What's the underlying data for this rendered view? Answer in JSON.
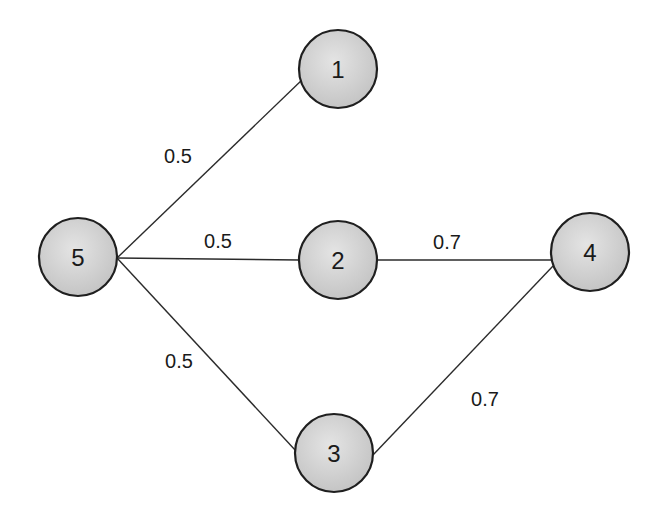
{
  "diagram": {
    "type": "weighted-graph",
    "colors": {
      "node_fill_light": "#e2e2e2",
      "node_fill_dark": "#c4c4c4",
      "node_stroke": "#1f1f1f",
      "edge": "#2b2b2b",
      "text": "#1a1a1a",
      "background": "#ffffff"
    },
    "nodes": [
      {
        "id": "1",
        "label": "1",
        "cx": 338,
        "cy": 69
      },
      {
        "id": "2",
        "label": "2",
        "cx": 338,
        "cy": 260
      },
      {
        "id": "3",
        "label": "3",
        "cx": 334,
        "cy": 453
      },
      {
        "id": "4",
        "label": "4",
        "cx": 590,
        "cy": 252
      },
      {
        "id": "5",
        "label": "5",
        "cx": 78,
        "cy": 257
      }
    ],
    "edges": [
      {
        "from": "5",
        "to": "1",
        "weight": "0.5",
        "label_x": 178,
        "label_y": 156
      },
      {
        "from": "5",
        "to": "2",
        "weight": "0.5",
        "label_x": 218,
        "label_y": 241
      },
      {
        "from": "5",
        "to": "3",
        "weight": "0.5",
        "label_x": 179,
        "label_y": 361
      },
      {
        "from": "2",
        "to": "4",
        "weight": "0.7",
        "label_x": 447,
        "label_y": 242
      },
      {
        "from": "3",
        "to": "4",
        "weight": "0.7",
        "label_x": 485,
        "label_y": 399
      }
    ]
  }
}
